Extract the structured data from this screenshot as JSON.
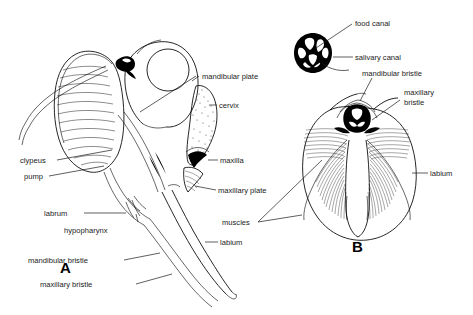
{
  "figure": {
    "background_color": "#ffffff",
    "ink_color": "#000000",
    "panels": [
      {
        "letter": "A",
        "description": "lateral view of head and mouthparts"
      },
      {
        "letter": "B",
        "description": "frontal view of labium with muscles"
      }
    ]
  },
  "panel_a": {
    "letter": "A",
    "labels": {
      "mandibular_plate": "mandibular plate",
      "cervix": "cervix",
      "maxilla": "maxilla",
      "maxillary_plate": "maxillary plate",
      "labium": "labium",
      "clypeus": "clypeus",
      "pump": "pump",
      "labrum": "labrum",
      "hypopharynx": "hypopharynx",
      "mandibular_bristle": "mandibular bristle",
      "maxillary_bristle": "maxillary bristle"
    }
  },
  "panel_b": {
    "letter": "B",
    "labels": {
      "food_canal": "food canal",
      "salivary_canal": "salivary canal",
      "mandibular_bristle": "mandibular bristle",
      "maxillary_bristle": "maxillary bristle",
      "labium": "labium",
      "muscles": "muscles"
    }
  }
}
